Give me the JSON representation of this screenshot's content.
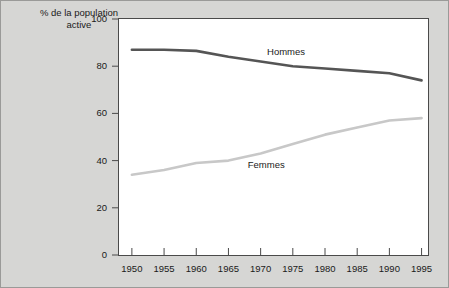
{
  "chart_data": {
    "type": "line",
    "xlabel": "",
    "ylabel": "% de la population active",
    "xlim": [
      1948,
      1996
    ],
    "ylim": [
      0,
      100
    ],
    "grid": false,
    "legend_position": "inline-labels",
    "x_ticks": [
      "1950",
      "1955",
      "1960",
      "1965",
      "1970",
      "1975",
      "1980",
      "1985",
      "1990",
      "1995"
    ],
    "y_ticks": [
      "0",
      "20",
      "40",
      "60",
      "80",
      "100"
    ],
    "x": [
      1950,
      1955,
      1960,
      1965,
      1970,
      1975,
      1980,
      1985,
      1990,
      1995
    ],
    "series": [
      {
        "name": "Hommes",
        "color": "#555555",
        "values": [
          87,
          87,
          86.5,
          84,
          82,
          80,
          79,
          78,
          77,
          74
        ],
        "label_x": 1971,
        "label_y": 86
      },
      {
        "name": "Femmes",
        "color": "#c8c8c8",
        "values": [
          34,
          36,
          39,
          40,
          43,
          47,
          51,
          54,
          57,
          58
        ],
        "label_x": 1968,
        "label_y": 38
      }
    ],
    "annotations": []
  },
  "axis": {
    "title_line1": "% de la population",
    "title_line2": "active"
  }
}
